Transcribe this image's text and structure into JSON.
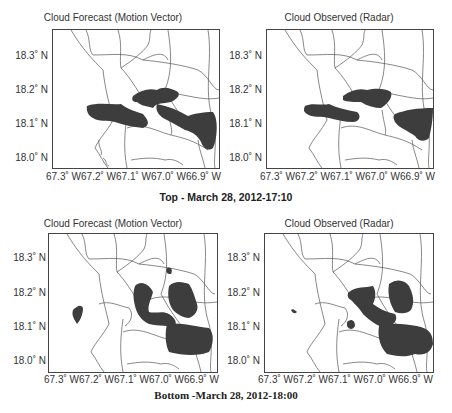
{
  "panels": [
    {
      "id": "top-left",
      "title": "Cloud Forecast (Motion Vector)"
    },
    {
      "id": "top-right",
      "title": "Cloud Observed (Radar)"
    },
    {
      "id": "bottom-left",
      "title": "Cloud Forecast (Motion Vector)"
    },
    {
      "id": "bottom-right",
      "title": "Cloud Observed (Radar)"
    }
  ],
  "axes": {
    "y_ticks": [
      "18.3˚ N",
      "18.2˚ N",
      "18.1˚ N",
      "18.0˚ N"
    ],
    "x_ticks": "67.3˚ W67.2˚ W67.1˚ W67.0˚ W66.9˚ W"
  },
  "captions": {
    "top": "Top - March 28, 2012-17:10",
    "bottom": "Bottom -March 28, 2012-18:00"
  },
  "colors": {
    "cloud": "#3d3d3d",
    "border": "#555555"
  }
}
